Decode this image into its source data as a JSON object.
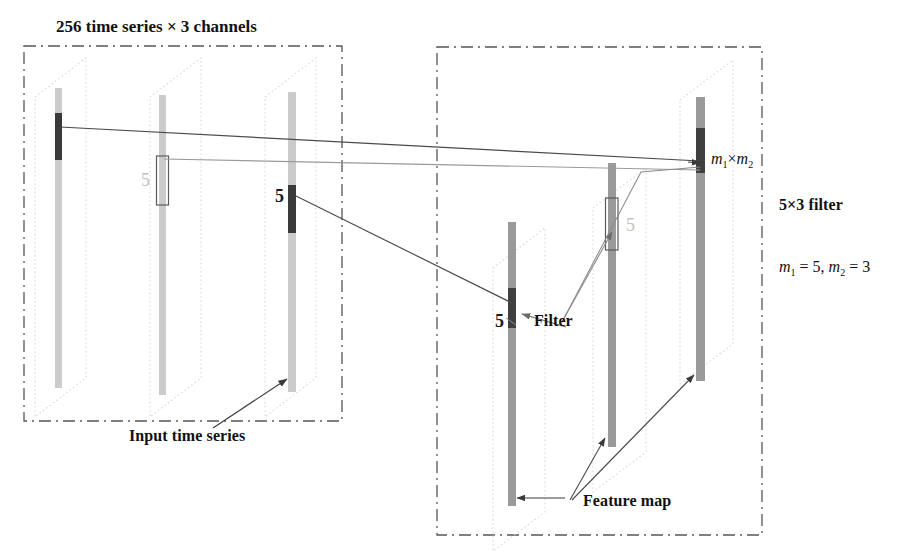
{
  "figure": {
    "type": "diagram",
    "title": "256 time series × 3 channels"
  },
  "labels": {
    "title": "256 time series × 3 channels",
    "input_time_series": "Input time series",
    "filter": "Filter",
    "feature_map": "Feature map",
    "filter_size": "5×3 filter",
    "five_left_mid": "5",
    "five_left_right": "5",
    "five_right_left": "5",
    "five_right_mid": "5"
  },
  "math": {
    "m1_times_m2": {
      "m": "m",
      "sub1": "1",
      "times": "×",
      "m2": "m",
      "sub2": "2"
    },
    "m_values": {
      "m": "m",
      "sub1": "1",
      "eq1": " = 5, ",
      "m_b": "m",
      "sub2": "2",
      "eq2": " = 3"
    },
    "m1_value": "5",
    "m2_value": "3"
  },
  "colors": {
    "panel_border": "#555555",
    "plane_outline": "#d8d8d8",
    "bar_input": "#cbcbcb",
    "bar_output": "#9a9a9a",
    "segment_dark": "#3a3a3a",
    "segment_mid": "#5c5c5c",
    "connector": "#4a4a4a",
    "connector_light": "#8e8e8e",
    "text": "#111111",
    "text_light": "#c2c2c2",
    "background": "#ffffff"
  },
  "panels": [
    {
      "name": "input-panel",
      "label": "256 time series × 3 channels",
      "slices": 3
    },
    {
      "name": "output-panel",
      "label": "Feature map",
      "slices": 3
    }
  ],
  "annotations": [
    {
      "name": "input-time-series",
      "text": "Input time series"
    },
    {
      "name": "filter",
      "text": "Filter"
    },
    {
      "name": "feature-map",
      "text": "Feature map"
    },
    {
      "name": "filter-dimensions",
      "text": "5×3 filter"
    }
  ]
}
